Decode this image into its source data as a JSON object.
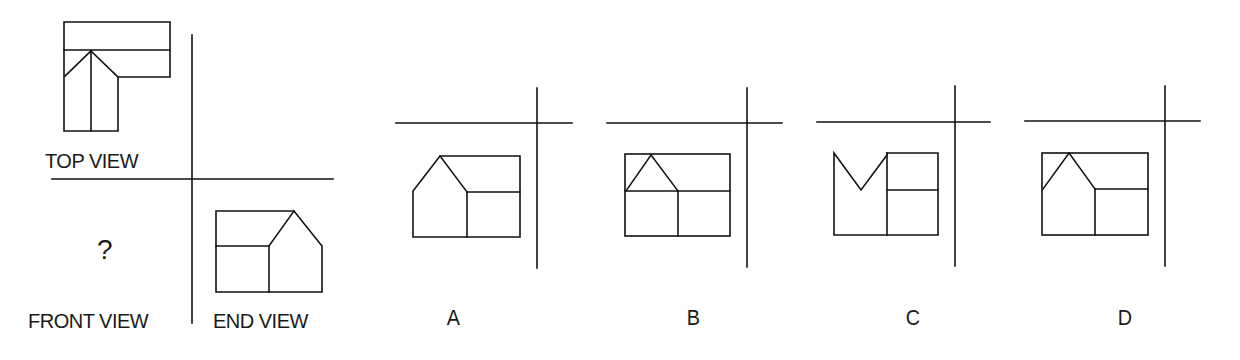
{
  "problem": {
    "type": "orthographic-projection",
    "question_mark": "?",
    "views": {
      "top_view_label": "TOP VIEW",
      "front_view_label": "FRONT VIEW",
      "end_view_label": "END VIEW"
    },
    "options": [
      {
        "label": "A"
      },
      {
        "label": "B"
      },
      {
        "label": "C"
      },
      {
        "label": "D"
      }
    ]
  },
  "colors": {
    "line": "#111111",
    "background": "#ffffff",
    "text": "#1a1a1a"
  }
}
